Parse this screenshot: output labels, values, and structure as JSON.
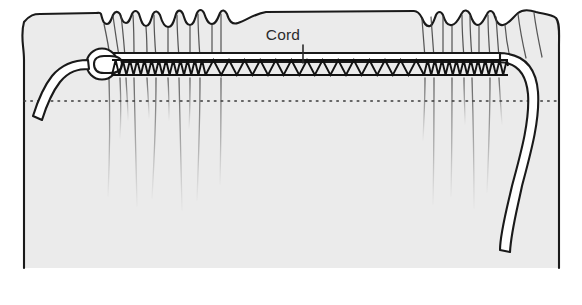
{
  "figure": {
    "canvas": {
      "width": 582,
      "height": 305
    },
    "colors": {
      "background": "#ffffff",
      "fabric_fill": "#ebebeb",
      "outline": "#1a1a1a",
      "drape_line": "#6f6f6f",
      "cord_fill": "#ffffff",
      "label_text": "#2b2b2b",
      "dotted_line": "#3a3a3a"
    }
  },
  "labels": {
    "cord": {
      "text": "Cord",
      "x": 283,
      "y": 40,
      "leader_from": [
        303,
        45
      ],
      "leader_to": [
        303,
        63
      ]
    }
  },
  "parts": {
    "fabric_panel": {
      "name": "gathered fabric panel",
      "left_edge_x": 22,
      "right_edge_x": 560,
      "bottom_y": 270,
      "top_y": 10
    },
    "stitching": {
      "name": "zigzag machine stitching",
      "rail_top_y": 60,
      "rail_bottom_y": 75,
      "start_x": 112,
      "end_x": 508,
      "segments": [
        {
          "from_x": 112,
          "to_x": 205,
          "pitch": 7.2,
          "density": "fine"
        },
        {
          "from_x": 205,
          "to_x": 425,
          "pitch": 15.5,
          "density": "wide"
        },
        {
          "from_x": 425,
          "to_x": 508,
          "pitch": 7.2,
          "density": "fine"
        }
      ]
    },
    "cord": {
      "name": "cord",
      "width": 9,
      "knot_center": [
        102,
        64
      ],
      "knot_radius": 15,
      "free_end_left": [
        33,
        120
      ],
      "free_end_right": [
        512,
        252
      ]
    },
    "dotted_guideline": {
      "name": "seam guideline",
      "y": 101,
      "from_x": 24,
      "to_x": 558
    }
  },
  "icons": {
    "leader_line": "leader-line-icon"
  }
}
